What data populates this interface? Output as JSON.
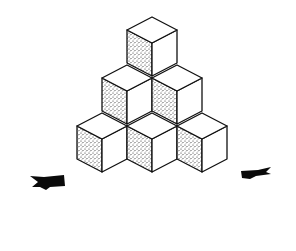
{
  "figure": {
    "background": "#ffffff",
    "line_color": "#111111",
    "stipple_color": "#222222",
    "cube_geometry": {
      "half_width": 25,
      "rhombus_half_height": 13,
      "vertical_edge": 33
    },
    "cubes": [
      {
        "row": "top",
        "top_x": 152,
        "top_y": 17
      },
      {
        "row": "middle",
        "top_x": 127,
        "top_y": 65
      },
      {
        "row": "middle",
        "top_x": 177,
        "top_y": 65
      },
      {
        "row": "bottom",
        "top_x": 102,
        "top_y": 113
      },
      {
        "row": "bottom",
        "top_x": 152,
        "top_y": 113
      },
      {
        "row": "bottom",
        "top_x": 202,
        "top_y": 113
      }
    ],
    "arrows": [
      {
        "position": "left",
        "x": 30,
        "y": 176
      },
      {
        "position": "right",
        "x": 238,
        "y": 167
      }
    ]
  }
}
